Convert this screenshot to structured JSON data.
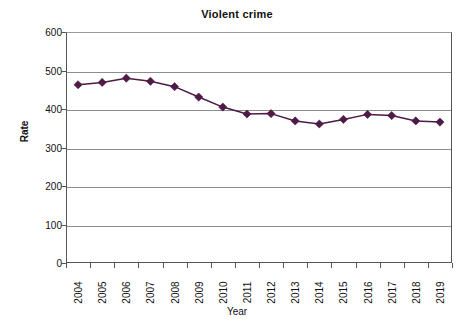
{
  "chart_data": {
    "type": "line",
    "title": "Violent crime",
    "xlabel": "Year",
    "ylabel": "Rate",
    "categories": [
      "2004",
      "2005",
      "2006",
      "2007",
      "2008",
      "2009",
      "2010",
      "2011",
      "2012",
      "2013",
      "2014",
      "2015",
      "2016",
      "2017",
      "2018",
      "2019"
    ],
    "values": [
      463,
      469,
      480,
      472,
      458,
      431,
      405,
      387,
      388,
      369,
      361,
      373,
      386,
      383,
      369,
      366
    ],
    "series": [
      {
        "name": "Violent crime rate",
        "values": [
          463,
          469,
          480,
          472,
          458,
          431,
          405,
          387,
          388,
          369,
          361,
          373,
          386,
          383,
          369,
          366
        ]
      }
    ],
    "ylim": [
      0,
      600
    ],
    "y_ticks": [
      0,
      100,
      200,
      300,
      400,
      500,
      600
    ],
    "y_tick_labels": [
      "0",
      "100",
      "200",
      "300",
      "400",
      "500",
      "600"
    ],
    "grid": "horizontal",
    "legend": "none",
    "marker": "diamond",
    "series_color": "#4e1a46",
    "gridline_color": "#8d8d8d",
    "axis_color": "#555555",
    "background_color": "#ffffff"
  },
  "axis_titles": {
    "x": "Year",
    "y": "Rate"
  },
  "header": {
    "title": "Violent crime"
  }
}
